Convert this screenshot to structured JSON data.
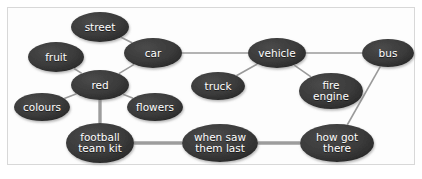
{
  "diagram": {
    "background_color": "#fdfdfd",
    "frame_color": "#d8d8d8",
    "node_fill": "#3a3a3a",
    "node_fill_dark": "#2a2a2a",
    "node_text_color": "#ffffff",
    "edge_color": "#9a9a9a",
    "edge_color_thick": "#9d9d9d",
    "nodes": [
      {
        "id": "street",
        "label": "street",
        "cx": 100,
        "cy": 27,
        "rx": 29,
        "ry": 15,
        "font_size": 10.5
      },
      {
        "id": "fruit",
        "label": "fruit",
        "cx": 56,
        "cy": 57,
        "rx": 28,
        "ry": 15,
        "font_size": 10.5
      },
      {
        "id": "car",
        "label": "car",
        "cx": 153,
        "cy": 53,
        "rx": 29,
        "ry": 15,
        "font_size": 10.5
      },
      {
        "id": "red",
        "label": "red",
        "cx": 100,
        "cy": 85,
        "rx": 29,
        "ry": 15,
        "font_size": 10.5
      },
      {
        "id": "colours",
        "label": "colours",
        "cx": 42,
        "cy": 107,
        "rx": 28,
        "ry": 14,
        "font_size": 10.5
      },
      {
        "id": "flowers",
        "label": "flowers",
        "cx": 155,
        "cy": 107,
        "rx": 28,
        "ry": 14,
        "font_size": 10.5
      },
      {
        "id": "truck",
        "label": "truck",
        "cx": 218,
        "cy": 86,
        "rx": 27,
        "ry": 14,
        "font_size": 10.5
      },
      {
        "id": "vehicle",
        "label": "vehicle",
        "cx": 277,
        "cy": 53,
        "rx": 29,
        "ry": 15,
        "font_size": 10.5
      },
      {
        "id": "fire",
        "label": "fire\nengine",
        "cx": 331,
        "cy": 91,
        "rx": 32,
        "ry": 18,
        "font_size": 10.5
      },
      {
        "id": "bus",
        "label": "bus",
        "cx": 388,
        "cy": 53,
        "rx": 26,
        "ry": 14,
        "font_size": 10.5
      },
      {
        "id": "football",
        "label": "football\nteam kit",
        "cx": 100,
        "cy": 143,
        "rx": 34,
        "ry": 20,
        "font_size": 10.5
      },
      {
        "id": "whensaw",
        "label": "when saw\nthem last",
        "cx": 220,
        "cy": 143,
        "rx": 38,
        "ry": 19,
        "font_size": 10.5
      },
      {
        "id": "howgot",
        "label": "how got\nthere",
        "cx": 337,
        "cy": 143,
        "rx": 37,
        "ry": 19,
        "font_size": 10.5
      }
    ],
    "edges": [
      {
        "from": "street",
        "to": "car",
        "width": 1.6
      },
      {
        "from": "fruit",
        "to": "red",
        "width": 1.6
      },
      {
        "from": "car",
        "to": "red",
        "width": 1.6
      },
      {
        "from": "car",
        "to": "vehicle",
        "width": 1.6
      },
      {
        "from": "red",
        "to": "colours",
        "width": 1.6
      },
      {
        "from": "red",
        "to": "flowers",
        "width": 1.6
      },
      {
        "from": "red",
        "to": "football",
        "width": 3.4
      },
      {
        "from": "truck",
        "to": "vehicle",
        "width": 1.6
      },
      {
        "from": "vehicle",
        "to": "fire",
        "width": 1.6
      },
      {
        "from": "vehicle",
        "to": "bus",
        "width": 1.6
      },
      {
        "from": "bus",
        "to": "howgot",
        "width": 1.6
      },
      {
        "from": "football",
        "to": "whensaw",
        "width": 3.4
      },
      {
        "from": "whensaw",
        "to": "howgot",
        "width": 3.4
      }
    ]
  }
}
